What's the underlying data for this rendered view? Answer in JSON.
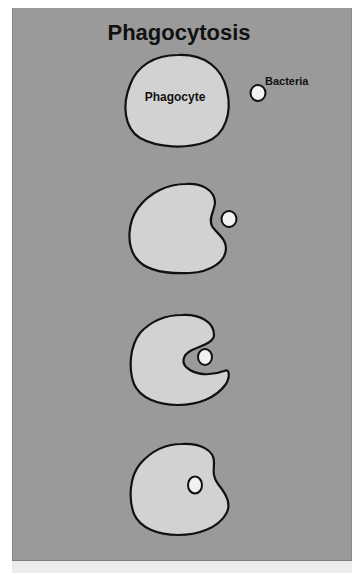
{
  "title": "Phagocytosis",
  "labels": {
    "cell": "Phagocyte",
    "bacteria": "Bacteria"
  },
  "colors": {
    "background": "#9a9a9a",
    "cell_fill": "#d2d2d2",
    "bacteria_fill": "#f2f2f2",
    "outline": "#111111"
  },
  "stages": [
    {
      "step": 1,
      "description": "Phagocyte approaches bacteria"
    },
    {
      "step": 2,
      "description": "Phagocyte begins to engulf bacteria"
    },
    {
      "step": 3,
      "description": "Pseudopods surround bacteria"
    },
    {
      "step": 4,
      "description": "Bacteria enclosed inside phagocyte"
    }
  ]
}
